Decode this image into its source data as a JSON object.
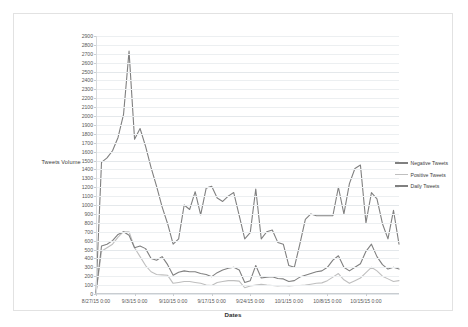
{
  "chart_data": {
    "type": "line",
    "title": "",
    "xlabel": "Dates",
    "ylabel": "Tweets Volume",
    "ylim": [
      0,
      2900
    ],
    "ystep": 100,
    "grid": true,
    "legend_position": "right",
    "ytick_labels": [
      "0",
      "100",
      "200",
      "300",
      "400",
      "500",
      "600",
      "700",
      "800",
      "900",
      "1000",
      "1100",
      "1200",
      "1300",
      "1400",
      "1500",
      "1600",
      "1700",
      "1800",
      "1900",
      "2000",
      "2100",
      "2200",
      "2300",
      "2400",
      "2500",
      "2600",
      "2700",
      "2800",
      "2900"
    ],
    "xtick_labels": [
      "8/27/15 0:00",
      "9/3/15 0:00",
      "9/10/15 0:00",
      "9/17/15 0:00",
      "9/24/15 0:00",
      "10/1/15 0:00",
      "10/8/15 0:00",
      "10/15/15 0:00"
    ],
    "xtick_indices": [
      0,
      7,
      14,
      21,
      28,
      35,
      42,
      49
    ],
    "n_points": 56,
    "series": [
      {
        "name": "Negative Tweets",
        "color": "#808080",
        "values": [
          20,
          1480,
          1530,
          1610,
          1760,
          2020,
          2730,
          1740,
          1860,
          1660,
          1420,
          1210,
          980,
          790,
          560,
          620,
          1000,
          950,
          1150,
          890,
          1190,
          1210,
          1080,
          1040,
          1100,
          1140,
          880,
          620,
          690,
          1180,
          620,
          700,
          720,
          580,
          560,
          320,
          300,
          560,
          840,
          900,
          880,
          880,
          880,
          880,
          1200,
          900,
          1240,
          1410,
          1450,
          800,
          1140,
          1070,
          790,
          620,
          940,
          560
        ]
      },
      {
        "name": "Positive Tweets",
        "color": "#bfbfbf",
        "values": [
          5,
          480,
          520,
          560,
          640,
          700,
          700,
          520,
          420,
          320,
          250,
          220,
          215,
          210,
          120,
          130,
          140,
          140,
          130,
          120,
          100,
          95,
          130,
          140,
          150,
          150,
          145,
          70,
          90,
          100,
          110,
          100,
          95,
          90,
          95,
          90,
          95,
          95,
          100,
          110,
          120,
          125,
          150,
          190,
          230,
          160,
          120,
          150,
          180,
          240,
          300,
          260,
          200,
          170,
          140,
          150
        ]
      },
      {
        "name": "Daily Tweets",
        "color": "#808080",
        "values": [
          10,
          540,
          560,
          600,
          670,
          700,
          660,
          520,
          540,
          510,
          400,
          380,
          420,
          330,
          210,
          245,
          260,
          250,
          250,
          230,
          220,
          195,
          240,
          270,
          290,
          300,
          270,
          130,
          150,
          320,
          180,
          190,
          195,
          175,
          170,
          140,
          150,
          190,
          210,
          230,
          250,
          260,
          300,
          380,
          430,
          300,
          260,
          300,
          340,
          480,
          560,
          420,
          330,
          280,
          300,
          280
        ]
      }
    ]
  },
  "legend": {
    "items": [
      {
        "label": "Negative Tweets"
      },
      {
        "label": "Positive Tweets"
      },
      {
        "label": "Daily Tweets"
      }
    ]
  }
}
